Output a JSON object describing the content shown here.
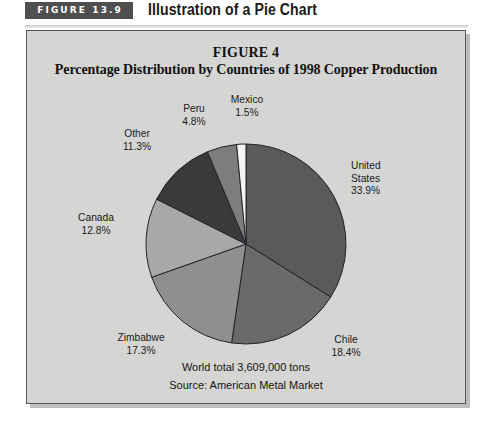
{
  "header": {
    "badge_label": "FIGURE 13.9",
    "title": "Illustration of a Pie Chart"
  },
  "chart_data": {
    "type": "pie",
    "title": "FIGURE 4",
    "subtitle": "Percentage Distribution by Countries of 1998 Copper Production",
    "categories": [
      "United States",
      "Chile",
      "Zimbabwe",
      "Canada",
      "Other",
      "Peru",
      "Mexico"
    ],
    "values": [
      33.9,
      18.4,
      17.3,
      12.8,
      11.3,
      4.8,
      1.5
    ],
    "value_suffix": "%",
    "colors": [
      "#5a5a5a",
      "#6a6a6a",
      "#8f8f8f",
      "#a8a8a8",
      "#3a3a3a",
      "#7d7d7d",
      "#f4f4f2"
    ],
    "start_angle": 0,
    "direction": "clockwise",
    "legend": "none",
    "labels": [
      {
        "name": "United States",
        "text": "United\nStates",
        "value": "33.9%"
      },
      {
        "name": "Chile",
        "text": "Chile",
        "value": "18.4%"
      },
      {
        "name": "Zimbabwe",
        "text": "Zimbabwe",
        "value": "17.3%"
      },
      {
        "name": "Canada",
        "text": "Canada",
        "value": "12.8%"
      },
      {
        "name": "Other",
        "text": "Other",
        "value": "11.3%"
      },
      {
        "name": "Peru",
        "text": "Peru",
        "value": "4.8%"
      },
      {
        "name": "Mexico",
        "text": "Mexico",
        "value": "1.5%"
      }
    ],
    "annotations": [
      "World total 3,609,000 tons",
      "Source: American Metal Market"
    ]
  },
  "slice_labels": {
    "united_states_l1": "United",
    "united_states_l2": "States",
    "united_states_pct": "33.9%",
    "chile_name": "Chile",
    "chile_pct": "18.4%",
    "zimbabwe_name": "Zimbabwe",
    "zimbabwe_pct": "17.3%",
    "canada_name": "Canada",
    "canada_pct": "12.8%",
    "other_name": "Other",
    "other_pct": "11.3%",
    "peru_name": "Peru",
    "peru_pct": "4.8%",
    "mexico_name": "Mexico",
    "mexico_pct": "1.5%"
  },
  "footnotes": {
    "total": "World total 3,609,000 tons",
    "source": "Source: American Metal Market"
  }
}
